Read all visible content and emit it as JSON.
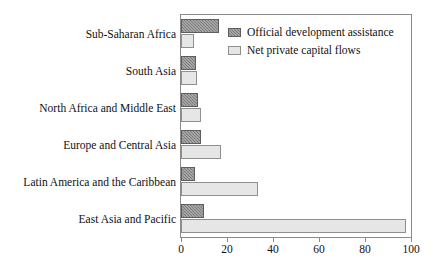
{
  "chart_data": {
    "type": "bar",
    "orientation": "horizontal",
    "title": "",
    "subtitle": "",
    "xlabel": "",
    "ylabel": "",
    "xlim": [
      0,
      100
    ],
    "xticks": [
      0,
      20,
      40,
      60,
      80,
      100
    ],
    "xtick_labels": [
      "0",
      "20",
      "40",
      "60",
      "80",
      "100"
    ],
    "grid": false,
    "legend_position": "top-right",
    "categories": [
      "Sub-Saharan Africa",
      "South Asia",
      "North Africa and Middle East",
      "Europe and Central Asia",
      "Latin America and the Caribbean",
      "East Asia and Pacific"
    ],
    "series": [
      {
        "name": "Official development assistance",
        "color": "#7d7d7d",
        "values": [
          16.5,
          6.5,
          7.5,
          8.5,
          6.0,
          10.0
        ]
      },
      {
        "name": "Net private capital flows",
        "color": "#e6e6e6",
        "values": [
          5.5,
          7.0,
          8.5,
          17.5,
          33.5,
          98.0
        ]
      }
    ]
  },
  "legend": {
    "items": [
      {
        "label": "Official development assistance",
        "swatch": "oda"
      },
      {
        "label": "Net private capital flows",
        "swatch": "npcf"
      }
    ]
  }
}
